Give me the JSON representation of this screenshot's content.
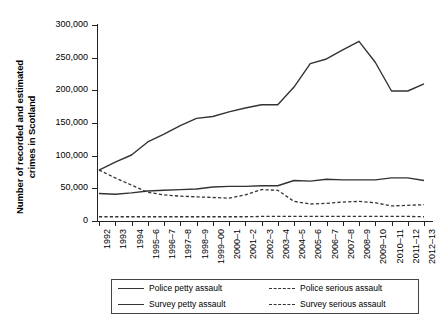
{
  "chart_data": {
    "type": "line",
    "title": "",
    "xlabel": "",
    "ylabel": "Number of recorded and estimated crimes in Scotland",
    "ylabel_line1": "Number of recorded and estimated",
    "ylabel_line2": "crimes in Scotland",
    "ylim": [
      0,
      300000
    ],
    "ytick_values": [
      0,
      50000,
      100000,
      150000,
      200000,
      250000,
      300000
    ],
    "ytick_labels": [
      "0",
      "50,000",
      "100,000",
      "150,000",
      "200,000",
      "250,000",
      "300,000"
    ],
    "grid": false,
    "legend_position": "below",
    "categories": [
      "1992",
      "1993",
      "1994",
      "1995–6",
      "1996–7",
      "1997–8",
      "1998–9",
      "1999–00",
      "2000–1",
      "2001–2",
      "2002–3",
      "2003–4",
      "2004–5",
      "2005–6",
      "2006–7",
      "2007–8",
      "2008–9",
      "2009–10",
      "2010–11",
      "2011–12",
      "2012–13"
    ],
    "series": [
      {
        "name": "Police petty assault",
        "style": "solid",
        "color": "#333333",
        "values": [
          42000,
          41000,
          43000,
          46000,
          47000,
          48000,
          49000,
          52000,
          53000,
          53000,
          54000,
          54000,
          62000,
          61000,
          64000,
          63000,
          63000,
          63000,
          66000,
          66000,
          62000
        ]
      },
      {
        "name": "Police serious assault",
        "style": "dashed",
        "color": "#333333",
        "values": [
          6500,
          6500,
          6500,
          6500,
          6500,
          6500,
          6500,
          6500,
          6500,
          6500,
          7000,
          7000,
          7000,
          7000,
          7000,
          7000,
          7000,
          7000,
          7000,
          7000,
          6500
        ]
      },
      {
        "name": "Survey petty assault",
        "style": "solid",
        "color": "#333333",
        "values": [
          78000,
          90000,
          101000,
          121000,
          133000,
          146000,
          157000,
          160000,
          167000,
          173000,
          178000,
          178000,
          205000,
          241000,
          248000,
          262000,
          275000,
          243000,
          199000,
          199000,
          210000
        ]
      },
      {
        "name": "Survey serious assault",
        "style": "dashed",
        "color": "#333333",
        "values": [
          78000,
          66000,
          55000,
          44000,
          40000,
          38000,
          37000,
          36000,
          35000,
          40000,
          48000,
          47000,
          30000,
          26000,
          27000,
          29000,
          30000,
          28000,
          23000,
          24000,
          25000
        ]
      }
    ],
    "legend": [
      {
        "label": "Police petty assault",
        "style": "solid"
      },
      {
        "label": "Police serious assault",
        "style": "dashed"
      },
      {
        "label": "Survey petty assault",
        "style": "solid"
      },
      {
        "label": "Survey serious assault",
        "style": "dashed"
      }
    ]
  }
}
